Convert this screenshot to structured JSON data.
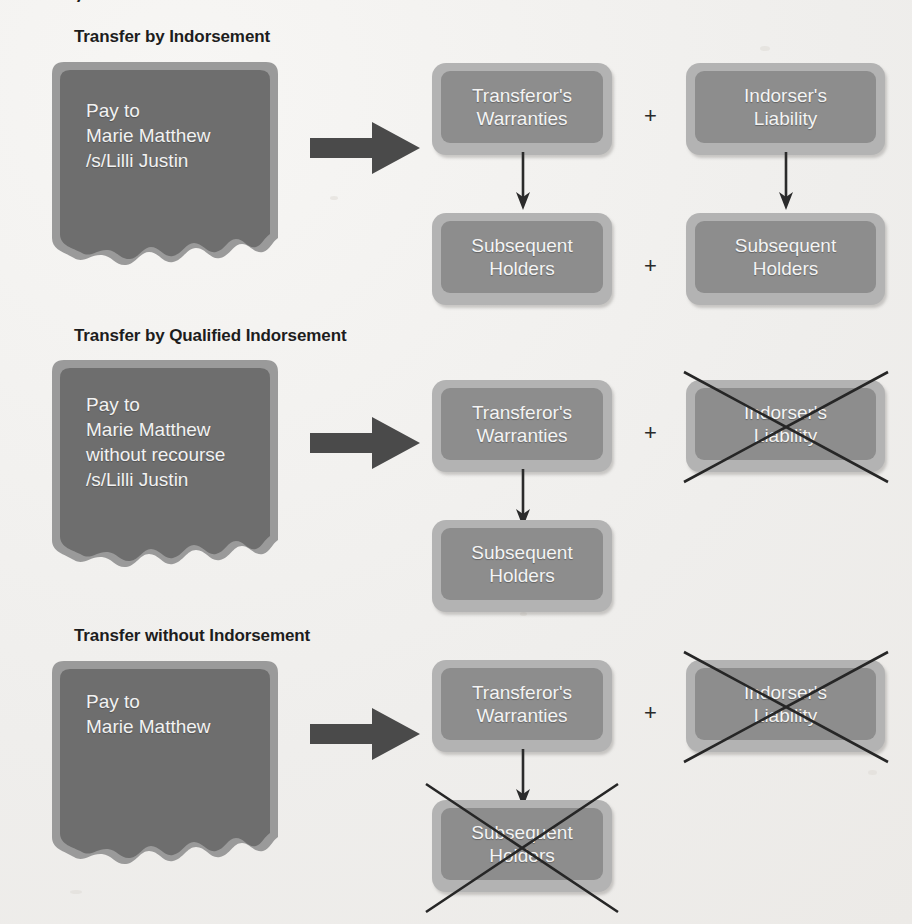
{
  "page": {
    "background_color": "#f2f1ef",
    "clipped_text_top": "y",
    "box_frame_color": "#b3b3b3",
    "box_fill_color": "#8d8d8d",
    "check_fill_color": "#6e6e6e",
    "check_border_color": "#9a9a9a",
    "arrow_color": "#4a4a4a",
    "text_color_light": "#f4f4f4",
    "title_color": "#1d1d1d"
  },
  "sections": [
    {
      "id": "transfer-by-indorsement",
      "title": "Transfer by Indorsement",
      "check": {
        "lines": [
          "Pay to",
          "Marie Matthew",
          "/s/Lilli Justin"
        ]
      },
      "arrow_label": "right-block-arrow",
      "plus_labels": [
        "+",
        "+"
      ],
      "boxes": [
        {
          "id": "transferors-warranties",
          "lines": [
            "Transferor's",
            "Warranties"
          ],
          "struck": false
        },
        {
          "id": "indorsers-liability",
          "lines": [
            "Indorser's",
            "Liability"
          ],
          "struck": false
        },
        {
          "id": "subsequent-holders-left",
          "lines": [
            "Subsequent",
            "Holders"
          ],
          "struck": false
        },
        {
          "id": "subsequent-holders-right",
          "lines": [
            "Subsequent",
            "Holders"
          ],
          "struck": false
        }
      ]
    },
    {
      "id": "transfer-by-qualified-indorsement",
      "title": "Transfer by Qualified Indorsement",
      "check": {
        "lines": [
          "Pay to",
          "Marie Matthew",
          "without recourse",
          "/s/Lilli Justin"
        ]
      },
      "arrow_label": "right-block-arrow",
      "plus_labels": [
        "+"
      ],
      "boxes": [
        {
          "id": "transferors-warranties",
          "lines": [
            "Transferor's",
            "Warranties"
          ],
          "struck": false
        },
        {
          "id": "indorsers-liability",
          "lines": [
            "Indorser's",
            "Liability"
          ],
          "struck": true
        },
        {
          "id": "subsequent-holders-left",
          "lines": [
            "Subsequent",
            "Holders"
          ],
          "struck": false
        }
      ]
    },
    {
      "id": "transfer-without-indorsement",
      "title": "Transfer without Indorsement",
      "check": {
        "lines": [
          "Pay to",
          "Marie Matthew"
        ]
      },
      "arrow_label": "right-block-arrow",
      "plus_labels": [
        "+"
      ],
      "boxes": [
        {
          "id": "transferors-warranties",
          "lines": [
            "Transferor's",
            "Warranties"
          ],
          "struck": false
        },
        {
          "id": "indorsers-liability",
          "lines": [
            "Indorser's",
            "Liability"
          ],
          "struck": true
        },
        {
          "id": "subsequent-holders-left",
          "lines": [
            "Subsequent",
            "Holders"
          ],
          "struck": true
        }
      ]
    }
  ]
}
